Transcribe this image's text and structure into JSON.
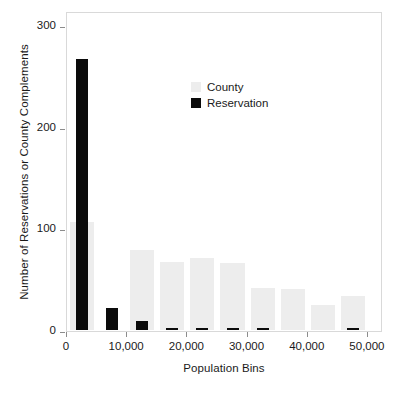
{
  "chart_data": {
    "type": "bar",
    "title": "",
    "xlabel": "Population Bins",
    "ylabel": "Number of Reservations or County Complements",
    "xlim": [
      0,
      52500
    ],
    "ylim": [
      0,
      315
    ],
    "grid": false,
    "bin_width": 5000,
    "legend_position": "upper-center",
    "x": [
      2500,
      7500,
      12500,
      17500,
      22500,
      27500,
      32500,
      37500,
      42500,
      47500
    ],
    "bin_ranges": [
      "0-5,000",
      "5,000-10,000",
      "10,000-15,000",
      "15,000-20,000",
      "20,000-25,000",
      "25,000-30,000",
      "30,000-35,000",
      "35,000-40,000",
      "40,000-45,000",
      "45,000-50,000"
    ],
    "series": [
      {
        "name": "County",
        "color": "#ededed",
        "values": [
          107,
          0,
          80,
          68,
          72,
          67,
          42,
          41,
          26,
          34
        ]
      },
      {
        "name": "Reservation",
        "color": "#0b0b0b",
        "values": [
          268,
          23,
          10,
          2,
          3,
          3,
          1,
          0,
          0,
          2
        ]
      }
    ],
    "yticks": [
      {
        "value": 0,
        "label": "0"
      },
      {
        "value": 100,
        "label": "100"
      },
      {
        "value": 200,
        "label": "200"
      },
      {
        "value": 300,
        "label": "300"
      }
    ],
    "xticks": [
      {
        "value": 0,
        "label": "0"
      },
      {
        "value": 10000,
        "label": "10,000"
      },
      {
        "value": 20000,
        "label": "20,000"
      },
      {
        "value": 30000,
        "label": "30,000"
      },
      {
        "value": 40000,
        "label": "40,000"
      },
      {
        "value": 50000,
        "label": "50,000"
      }
    ]
  },
  "legend": {
    "entries": [
      {
        "label": "County",
        "swatch": "county"
      },
      {
        "label": "Reservation",
        "swatch": "res"
      }
    ]
  }
}
